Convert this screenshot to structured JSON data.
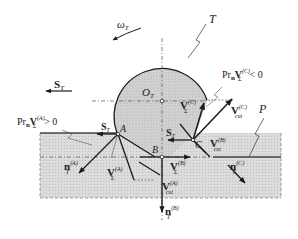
{
  "diagram": {
    "type": "grinding-tool-workpiece-kinematics",
    "labels": {
      "tool": "T",
      "workpiece": "P",
      "tool_center": "O",
      "tool_center_sub": "T",
      "omega": "ω",
      "omega_sub": "T",
      "feed_top": "S",
      "feed_top_sub": "T",
      "point_A": "A",
      "point_B": "B",
      "point_C": "C",
      "feed_A": "S",
      "feed_A_sub": "T",
      "feed_C": "S",
      "feed_C_sub": "T",
      "pr_A_prefix": "Pr",
      "pr_A_n": "n",
      "pr_A_V": "V",
      "pr_A_sub": "Σ",
      "pr_A_sup": "(A)",
      "pr_A_cond": "> 0",
      "pr_C_prefix": "Pr",
      "pr_C_n": "n",
      "pr_C_V": "V",
      "pr_C_sub": "Σ",
      "pr_C_sup": "(C)",
      "pr_C_cond": "< 0",
      "vsig_C": "V",
      "vsig_C_sub": "Σ",
      "vsig_C_sup": "(C)",
      "vcut_C": "V",
      "vcut_C_sub": "cut",
      "vcut_C_sup": "(C)",
      "vcut_B": "V",
      "vcut_B_sub": "cut",
      "vcut_B_sup": "(B)",
      "vsig_B": "V",
      "vsig_B_sub": "Σ",
      "vsig_B_sup": "(B)",
      "vsig_A": "V",
      "vsig_A_sub": "Σ",
      "vsig_A_sup": "(A)",
      "vcut_A": "V",
      "vcut_A_sub": "cut",
      "vcut_A_sup": "(A)",
      "n_A": "n",
      "n_A_sub": "T",
      "n_A_sup": "(A)",
      "n_B": "n",
      "n_B_sub": "T",
      "n_B_sup": "(B)",
      "n_C": "n",
      "n_C_sub": "T",
      "n_C_sup": "(C)"
    },
    "colors": {
      "fill_tool": "#c8c8c8",
      "fill_workpiece": "#d6d6d6",
      "stroke": "#1a1a1a"
    }
  }
}
